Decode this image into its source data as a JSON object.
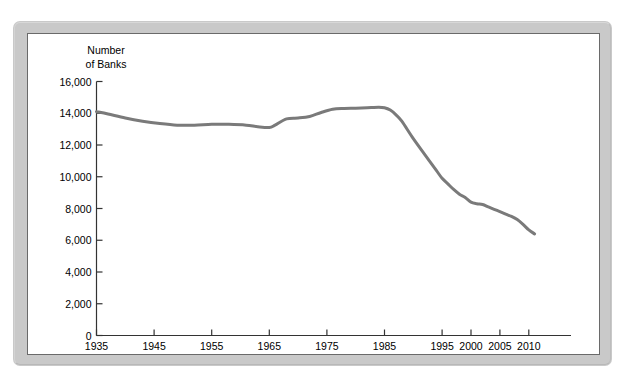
{
  "figure": {
    "name": "number-of-banks-line-chart",
    "frame_color": "#c9c9c9",
    "panel_border_color": "#6a6a6a",
    "panel_background": "#ffffff"
  },
  "axis_title": {
    "line1": "Number",
    "line2": "of Banks"
  },
  "chart_data": {
    "type": "line",
    "title": "",
    "subtitle": "",
    "xlabel": "",
    "ylabel": "Number of Banks",
    "grid": false,
    "legend": "none",
    "line_color": "#7a7a7a",
    "line_width": 3,
    "xlim": [
      1935,
      2011
    ],
    "ylim": [
      0,
      16000
    ],
    "ytick_values": [
      0,
      2000,
      4000,
      6000,
      8000,
      10000,
      12000,
      14000,
      16000
    ],
    "ytick_labels": [
      "0",
      "2,000",
      "4,000",
      "6,000",
      "8,000",
      "10,000",
      "12,000",
      "14,000",
      "16,000"
    ],
    "xtick_values": [
      1935,
      1945,
      1955,
      1965,
      1975,
      1985,
      1995,
      2000,
      2005,
      2010
    ],
    "xtick_labels": [
      "1935",
      "1945",
      "1955",
      "1965",
      "1975",
      "1985",
      "1995",
      "2000",
      "2005",
      "2010"
    ],
    "x_axis_note": "Tick spacing is 10 years from 1935 to 1995, then 5 years from 1995 to 2010",
    "x": [
      1935,
      1937,
      1940,
      1943,
      1946,
      1949,
      1952,
      1955,
      1958,
      1961,
      1963,
      1965,
      1966,
      1968,
      1970,
      1972,
      1974,
      1976,
      1978,
      1980,
      1982,
      1984,
      1985,
      1986,
      1987,
      1988,
      1990,
      1992,
      1994,
      1995,
      1996,
      1997,
      1998,
      1999,
      2000,
      2001,
      2002,
      2003,
      2004,
      2005,
      2006,
      2007,
      2008,
      2009,
      2010,
      2011
    ],
    "y": [
      14100,
      13950,
      13700,
      13500,
      13350,
      13250,
      13250,
      13300,
      13300,
      13250,
      13150,
      13100,
      13250,
      13650,
      13700,
      13800,
      14050,
      14250,
      14300,
      14320,
      14350,
      14380,
      14350,
      14200,
      13900,
      13500,
      12400,
      11400,
      10400,
      9900,
      9550,
      9200,
      8900,
      8700,
      8400,
      8300,
      8250,
      8100,
      7950,
      7800,
      7650,
      7500,
      7300,
      7000,
      6650,
      6400
    ]
  }
}
